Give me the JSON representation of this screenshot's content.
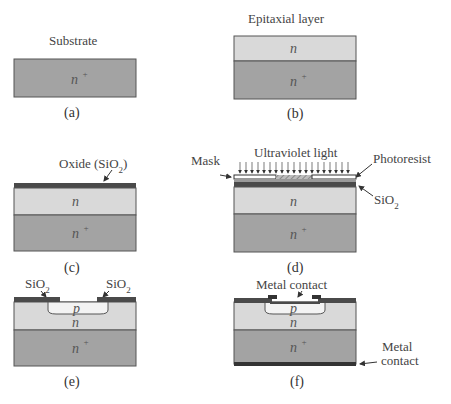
{
  "figure": {
    "colors": {
      "substrate": "#a3a3a3",
      "epitaxial": "#d9d9d9",
      "oxide": "#4a4a4a",
      "p_region": "#f3f3f3",
      "background": "#ffffff"
    },
    "panels": [
      {
        "id": "a",
        "caption": "(a)",
        "label": "Substrate",
        "layers": [
          "n+"
        ]
      },
      {
        "id": "b",
        "caption": "(b)",
        "label": "Epitaxial layer",
        "layers": [
          "n",
          "n+"
        ]
      },
      {
        "id": "c",
        "caption": "(c)",
        "label": "Oxide (SiO2)",
        "layers": [
          "SiO2",
          "n",
          "n+"
        ]
      },
      {
        "id": "d",
        "caption": "(d)",
        "labels": {
          "mask": "Mask",
          "uv": "Ultraviolet light",
          "photoresist": "Photoresist",
          "oxide": "SiO2"
        },
        "layers": [
          "Mask",
          "Photoresist",
          "SiO2",
          "n",
          "n+"
        ]
      },
      {
        "id": "e",
        "caption": "(e)",
        "labels": {
          "oxide_left": "SiO2",
          "oxide_right": "SiO2"
        },
        "layers": [
          "SiO2",
          "p",
          "n",
          "n+"
        ]
      },
      {
        "id": "f",
        "caption": "(f)",
        "labels": {
          "top_contact": "Metal contact",
          "bottom_contact_line1": "Metal",
          "bottom_contact_line2": "contact"
        },
        "layers": [
          "Metal",
          "SiO2",
          "p",
          "n",
          "n+",
          "Metal"
        ]
      }
    ],
    "region_labels": {
      "n_plus": "n",
      "plus": "+",
      "n": "n",
      "p": "p"
    }
  }
}
